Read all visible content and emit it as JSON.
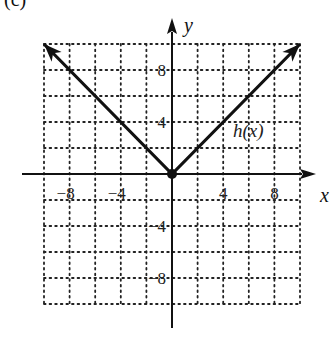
{
  "part_label": "(c)",
  "chart_data": {
    "type": "line",
    "title": "",
    "xlabel": "x",
    "ylabel": "y",
    "xlim": [
      -10,
      10
    ],
    "ylim": [
      -10,
      10
    ],
    "grid": true,
    "grid_step": 2,
    "x_ticks": [
      -8,
      -4,
      4,
      8
    ],
    "y_ticks": [
      8,
      4,
      -4,
      -8
    ],
    "x_tick_labels": [
      "−8",
      "−4",
      "4",
      "8"
    ],
    "y_tick_labels": [
      "8",
      "4",
      "−4",
      "−8"
    ],
    "series": [
      {
        "name": "h(x)",
        "label": "h(x)",
        "function": "|x|",
        "points": [
          [
            -10,
            10
          ],
          [
            0,
            0
          ],
          [
            10,
            10
          ]
        ],
        "endpoint_arrows": true,
        "vertex_dot": [
          0,
          0
        ],
        "color": "#111111"
      }
    ],
    "legend": "inline label near line, upper right"
  }
}
